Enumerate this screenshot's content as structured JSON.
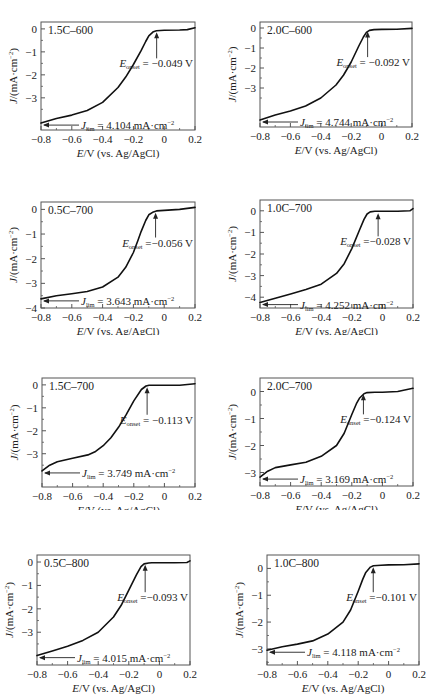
{
  "chart_data": [
    {
      "type": "line",
      "title": "1.5C-600",
      "xlabel": "E/V (vs. Ag/AgCl)",
      "ylabel": "J/(mA·cm⁻²)",
      "xlim": [
        -0.8,
        0.2
      ],
      "ylim": [
        -4.4,
        0.3
      ],
      "xticks": [
        -0.8,
        -0.6,
        -0.4,
        -0.2,
        0,
        0.2
      ],
      "xtick_labels": [
        "-0.8",
        "-0.6",
        "-0.4",
        "-0.2",
        "0",
        "0.2"
      ],
      "yticks": [
        0,
        -1,
        -2,
        -3
      ],
      "ytick_labels": [
        "0",
        "-1",
        "-2",
        "-3"
      ],
      "onset_label": "= -0.049 V",
      "onset_value": -0.049,
      "jlim_label": "= 4.104 mA·cm⁻²",
      "jlim_value": 4.104,
      "x": [
        -0.8,
        -0.7,
        -0.6,
        -0.5,
        -0.4,
        -0.3,
        -0.25,
        -0.2,
        -0.15,
        -0.12,
        -0.1,
        -0.07,
        -0.05,
        0,
        0.1,
        0.15,
        0.2
      ],
      "y": [
        -4.1,
        -3.9,
        -3.75,
        -3.55,
        -3.2,
        -2.55,
        -2.1,
        -1.55,
        -0.95,
        -0.55,
        -0.3,
        -0.12,
        -0.08,
        -0.06,
        -0.05,
        -0.03,
        0.05
      ]
    },
    {
      "type": "line",
      "title": "2.0C-600",
      "xlabel": "E/V (vs. Ag/AgCl)",
      "ylabel": "J/(mA·cm⁻²)",
      "xlim": [
        -0.8,
        0.2
      ],
      "ylim": [
        -4.95,
        0.3
      ],
      "xticks": [
        -0.8,
        -0.6,
        -0.4,
        -0.2,
        0,
        0.2
      ],
      "xtick_labels": [
        "-0.8",
        "-0.6",
        "-0.4",
        "-0.2",
        "0",
        "0.2"
      ],
      "yticks": [
        0,
        -1,
        -2,
        -3
      ],
      "ytick_labels": [
        "0",
        "-1",
        "-2",
        "-3"
      ],
      "onset_label": "= -0.092 V",
      "onset_value": -0.092,
      "jlim_label": "= 4.744 mA·cm⁻²",
      "jlim_value": 4.744,
      "x": [
        -0.8,
        -0.7,
        -0.6,
        -0.5,
        -0.4,
        -0.3,
        -0.25,
        -0.2,
        -0.15,
        -0.12,
        -0.1,
        -0.08,
        -0.05,
        0,
        0.1,
        0.2
      ],
      "y": [
        -4.6,
        -4.35,
        -4.15,
        -3.9,
        -3.5,
        -2.85,
        -2.35,
        -1.7,
        -0.9,
        -0.45,
        -0.22,
        -0.12,
        -0.08,
        -0.07,
        -0.06,
        -0.02
      ]
    },
    {
      "type": "line",
      "title": "0.5C-700",
      "xlabel": "E/V (vs. Ag/AgCl)",
      "ylabel": "J/(mA·cm⁻²)",
      "xlim": [
        -0.8,
        0.2
      ],
      "ylim": [
        -4.0,
        0.3
      ],
      "xticks": [
        -0.8,
        -0.6,
        -0.4,
        -0.2,
        0,
        0.2
      ],
      "xtick_labels": [
        "-0.8",
        "-0.6",
        "-0.4",
        "-0.2",
        "0",
        "0.2"
      ],
      "yticks": [
        0,
        -1,
        -2,
        -3,
        -4
      ],
      "ytick_labels": [
        "0",
        "-1",
        "-2",
        "-3",
        "-4"
      ],
      "onset_label": "=-0.056 V",
      "onset_value": -0.056,
      "jlim_label": "= 3.643 mA·cm⁻²",
      "jlim_value": 3.643,
      "x": [
        -0.8,
        -0.7,
        -0.6,
        -0.5,
        -0.4,
        -0.3,
        -0.25,
        -0.2,
        -0.17,
        -0.15,
        -0.12,
        -0.1,
        -0.07,
        -0.05,
        0,
        0.1,
        0.2
      ],
      "y": [
        -3.63,
        -3.5,
        -3.42,
        -3.33,
        -3.15,
        -2.75,
        -2.35,
        -1.75,
        -1.25,
        -0.9,
        -0.45,
        -0.22,
        -0.1,
        -0.06,
        -0.04,
        0.0,
        0.08
      ]
    },
    {
      "type": "line",
      "title": "1.0C-700",
      "xlabel": "E/V (vs. Ag/AgCl)",
      "ylabel": "J/(mA·cm⁻²)",
      "xlim": [
        -0.8,
        0.2
      ],
      "ylim": [
        -4.5,
        0.5
      ],
      "xticks": [
        -0.8,
        -0.6,
        -0.4,
        -0.2,
        0,
        0.2
      ],
      "xtick_labels": [
        "-0.8",
        "-0.6",
        "-0.4",
        "-0.2",
        "0",
        "0.2"
      ],
      "yticks": [
        0,
        -1,
        -2,
        -3,
        -4
      ],
      "ytick_labels": [
        "0",
        "-1",
        "-2",
        "-3",
        "-4"
      ],
      "onset_label": "=-0.028 V",
      "onset_value": -0.028,
      "jlim_label": "= 4.252 mA·cm⁻²",
      "jlim_value": 4.252,
      "x": [
        -0.8,
        -0.7,
        -0.6,
        -0.5,
        -0.4,
        -0.3,
        -0.25,
        -0.2,
        -0.15,
        -0.12,
        -0.1,
        -0.08,
        -0.05,
        0,
        0.1,
        0.18,
        0.2
      ],
      "y": [
        -4.25,
        -4.05,
        -3.85,
        -3.65,
        -3.4,
        -2.9,
        -2.45,
        -1.75,
        -0.9,
        -0.4,
        -0.15,
        -0.05,
        -0.02,
        -0.02,
        -0.02,
        0.0,
        0.1
      ]
    },
    {
      "type": "line",
      "title": "1.5C-700",
      "xlabel": "E/V (vs. Ag/AgCl)",
      "ylabel": "J/(mA·cm⁻²)",
      "xlim": [
        -0.8,
        0.2
      ],
      "ylim": [
        -4.45,
        0.3
      ],
      "xticks": [
        -0.8,
        -0.6,
        -0.4,
        -0.2,
        0,
        0.2
      ],
      "xtick_labels": [
        "-0.8",
        "-0.6",
        "-0.4",
        "-0.2",
        "0",
        "0.2"
      ],
      "yticks": [
        0,
        -1,
        -2,
        -3
      ],
      "ytick_labels": [
        "0",
        "-1",
        "-2",
        "-3"
      ],
      "onset_label": "= -0.113 V",
      "onset_value": -0.113,
      "jlim_label": "= 3.749 mA·cm⁻²",
      "jlim_value": 3.749,
      "x": [
        -0.8,
        -0.75,
        -0.7,
        -0.6,
        -0.5,
        -0.45,
        -0.4,
        -0.35,
        -0.3,
        -0.25,
        -0.2,
        -0.15,
        -0.12,
        -0.1,
        -0.05,
        0,
        0.1,
        0.2
      ],
      "y": [
        -3.75,
        -3.5,
        -3.35,
        -3.2,
        -3.05,
        -2.9,
        -2.65,
        -2.3,
        -1.85,
        -1.3,
        -0.7,
        -0.2,
        -0.05,
        -0.02,
        -0.02,
        -0.02,
        -0.02,
        0.05
      ]
    },
    {
      "type": "line",
      "title": "2.0C-700",
      "xlabel": "E/V (vs. Ag/AgCl)",
      "ylabel": "J/(mA·cm⁻²)",
      "xlim": [
        -0.8,
        0.2
      ],
      "ylim": [
        -3.5,
        0.5
      ],
      "xticks": [
        -0.8,
        -0.6,
        -0.4,
        -0.2,
        0,
        0.2
      ],
      "xtick_labels": [
        "-0.8",
        "-0.6",
        "-0.4",
        "-0.2",
        "0",
        "0.2"
      ],
      "yticks": [
        0,
        -1,
        -2,
        -3
      ],
      "ytick_labels": [
        "0",
        "-1",
        "-2",
        "-3"
      ],
      "onset_label": "=-0.124 V",
      "onset_value": -0.124,
      "jlim_label": "= 3.169 mA·cm⁻²",
      "jlim_value": 3.169,
      "x": [
        -0.8,
        -0.75,
        -0.7,
        -0.6,
        -0.5,
        -0.4,
        -0.3,
        -0.25,
        -0.2,
        -0.17,
        -0.15,
        -0.12,
        -0.1,
        -0.05,
        0,
        0.1,
        0.2
      ],
      "y": [
        -3.17,
        -2.95,
        -2.82,
        -2.72,
        -2.62,
        -2.4,
        -2.0,
        -1.55,
        -0.85,
        -0.45,
        -0.25,
        -0.08,
        -0.04,
        -0.03,
        -0.03,
        0.0,
        0.12
      ]
    },
    {
      "type": "line",
      "title": "0.5C-800",
      "xlabel": "E/V (vs. Ag/AgCl)",
      "ylabel": "J/(mA·cm⁻²)",
      "xlim": [
        -0.8,
        0.2
      ],
      "ylim": [
        -4.4,
        0.3
      ],
      "xticks": [
        -0.8,
        -0.6,
        -0.4,
        -0.2,
        0,
        0.2
      ],
      "xtick_labels": [
        "-0.8",
        "-0.6",
        "-0.4",
        "-0.2",
        "0",
        "0.2"
      ],
      "yticks": [
        0,
        -1,
        -2,
        -3
      ],
      "ytick_labels": [
        "0",
        "-1",
        "-2",
        "-3"
      ],
      "onset_label": "=-0.093 V",
      "onset_value": -0.093,
      "jlim_label": "= 4.015 mA·cm⁻²",
      "jlim_value": 4.015,
      "x": [
        -0.8,
        -0.7,
        -0.6,
        -0.5,
        -0.4,
        -0.3,
        -0.25,
        -0.2,
        -0.15,
        -0.12,
        -0.1,
        -0.07,
        -0.05,
        0,
        0.1,
        0.18,
        0.2
      ],
      "y": [
        -4.0,
        -3.8,
        -3.6,
        -3.35,
        -3.0,
        -2.35,
        -1.85,
        -1.2,
        -0.55,
        -0.2,
        -0.08,
        -0.04,
        -0.03,
        -0.03,
        -0.03,
        -0.02,
        0.05
      ]
    },
    {
      "type": "line",
      "title": "1.0C-800",
      "xlabel": "E/V (vs. Ag/AgCl)",
      "ylabel": "J/(mA·cm⁻²)",
      "xlim": [
        -0.8,
        0.2
      ],
      "ylim": [
        -3.6,
        0.5
      ],
      "xticks": [
        -0.8,
        -0.6,
        -0.4,
        -0.2,
        0,
        0.2
      ],
      "xtick_labels": [
        "-0.8",
        "-0.6",
        "-0.4",
        "-0.2",
        "0",
        "0.2"
      ],
      "yticks": [
        0,
        -1,
        -2,
        -3
      ],
      "ytick_labels": [
        "0",
        "-1",
        "-2",
        "-3"
      ],
      "onset_label": "=-0.101 V",
      "onset_value": -0.101,
      "jlim_label": "= 4.118 mA·cm⁻²",
      "jlim_value": 4.118,
      "x": [
        -0.8,
        -0.7,
        -0.6,
        -0.5,
        -0.4,
        -0.3,
        -0.25,
        -0.2,
        -0.17,
        -0.15,
        -0.12,
        -0.1,
        -0.05,
        0,
        0.1,
        0.2
      ],
      "y": [
        -3.05,
        -2.92,
        -2.82,
        -2.7,
        -2.45,
        -2.0,
        -1.55,
        -0.85,
        -0.4,
        -0.15,
        0.05,
        0.1,
        0.12,
        0.13,
        0.14,
        0.17
      ]
    }
  ],
  "panels": [
    {
      "left": 0,
      "top": 0,
      "width": 220,
      "height": 165,
      "frame": [
        41,
        22,
        195,
        130
      ],
      "ylabel_present": true,
      "xlabel_present": true
    },
    {
      "left": 219,
      "top": 0,
      "width": 219,
      "height": 165,
      "frame": [
        41,
        22,
        193,
        127
      ],
      "ylabel_present": true,
      "xlabel_present": true
    },
    {
      "left": 0,
      "top": 170,
      "width": 220,
      "height": 165,
      "frame": [
        41,
        32,
        195,
        138
      ],
      "ylabel_present": true,
      "xlabel_present": true
    },
    {
      "left": 219,
      "top": 170,
      "width": 219,
      "height": 165,
      "frame": [
        41,
        30,
        194,
        138
      ],
      "ylabel_present": true,
      "xlabel_present": true
    },
    {
      "left": 0,
      "top": 340,
      "width": 220,
      "height": 170,
      "frame": [
        42,
        38,
        195,
        147
      ],
      "ylabel_present": true,
      "xlabel_present": true
    },
    {
      "left": 219,
      "top": 340,
      "width": 219,
      "height": 170,
      "frame": [
        41,
        38,
        194,
        146
      ],
      "ylabel_present": true,
      "xlabel_present": true
    },
    {
      "left": 0,
      "top": 520,
      "width": 220,
      "height": 175,
      "frame": [
        37,
        35,
        190,
        145
      ],
      "ylabel_present": true,
      "xlabel_present": true
    },
    {
      "left": 219,
      "top": 520,
      "width": 219,
      "height": 175,
      "frame": [
        48,
        35,
        200,
        145
      ],
      "ylabel_present": true,
      "xlabel_present": true
    }
  ],
  "labels": {
    "onset_symbol": "E",
    "onset_sub": "onset",
    "jlim_symbol": "J",
    "jlim_sub": "lim",
    "xlabel_italic": "E",
    "xlabel_rest": "/V (vs. Ag/AgCl)",
    "ylabel_italic": "J",
    "ylabel_rest": "/(mA·cm",
    "ylabel_sup": "−2",
    "ylabel_close": ")"
  }
}
